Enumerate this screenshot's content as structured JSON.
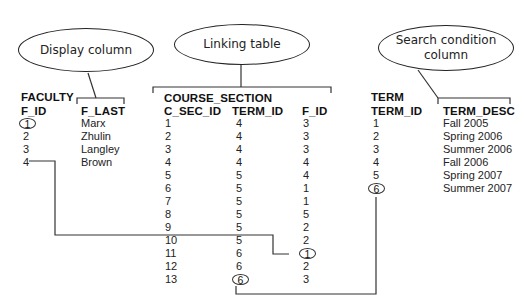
{
  "callouts": {
    "display": "Display column",
    "linking": "Linking table",
    "search_line1": "Search condition",
    "search_line2": "column"
  },
  "faculty": {
    "table_name": "FACULTY",
    "columns": [
      "F_ID",
      "F_LAST"
    ],
    "rows": [
      [
        "1",
        "Marx"
      ],
      [
        "2",
        "Zhulin"
      ],
      [
        "3",
        "Langley"
      ],
      [
        "4",
        "Brown"
      ]
    ]
  },
  "course_section": {
    "table_name": "COURSE_SECTION",
    "columns": [
      "C_SEC_ID",
      "TERM_ID",
      "F_ID"
    ],
    "rows": [
      [
        "1",
        "4",
        "3"
      ],
      [
        "2",
        "4",
        "3"
      ],
      [
        "3",
        "4",
        "3"
      ],
      [
        "4",
        "4",
        "4"
      ],
      [
        "5",
        "5",
        "4"
      ],
      [
        "6",
        "5",
        "1"
      ],
      [
        "7",
        "5",
        "1"
      ],
      [
        "8",
        "5",
        "5"
      ],
      [
        "9",
        "5",
        "2"
      ],
      [
        "10",
        "5",
        "2"
      ],
      [
        "11",
        "6",
        "1"
      ],
      [
        "12",
        "6",
        "2"
      ],
      [
        "13",
        "6",
        "3"
      ]
    ]
  },
  "term": {
    "table_name": "TERM",
    "columns": [
      "TERM_ID",
      "TERM_DESC"
    ],
    "rows": [
      [
        "1",
        "Fall 2005"
      ],
      [
        "2",
        "Spring 2006"
      ],
      [
        "3",
        "Summer 2006"
      ],
      [
        "4",
        "Fall 2006"
      ],
      [
        "5",
        "Spring 2007"
      ],
      [
        "6",
        "Summer 2007"
      ]
    ]
  },
  "highlights": {
    "faculty_f_id": "1",
    "course_section_f_id_row11": "1",
    "course_section_term_id_row13": "6",
    "term_term_id": "6"
  }
}
